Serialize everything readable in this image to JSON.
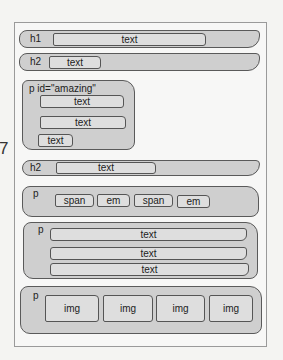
{
  "page_number": "7",
  "blocks": {
    "h1": {
      "label": "h1",
      "children": [
        "text"
      ]
    },
    "h2a": {
      "label": "h2",
      "children": [
        "text"
      ]
    },
    "p_amazing": {
      "label": "p id=\"amazing\"",
      "children": [
        "text",
        "text",
        "text"
      ]
    },
    "h2b": {
      "label": "h2",
      "children": [
        "text"
      ]
    },
    "p_inline": {
      "label": "p",
      "children": [
        "span",
        "em",
        "span",
        "em"
      ]
    },
    "p_text": {
      "label": "p",
      "children": [
        "text",
        "text",
        "text"
      ]
    },
    "p_img": {
      "label": "p",
      "children": [
        "img",
        "img",
        "img",
        "img"
      ]
    }
  }
}
